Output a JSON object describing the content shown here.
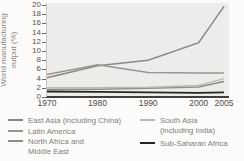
{
  "chart_data": {
    "type": "line",
    "title": "",
    "ylabel": "World manufacturing output (%)",
    "ylabel_lines": [
      "World manufacturing",
      "output (%)"
    ],
    "xlabel": "",
    "xlim": [
      1970,
      2005
    ],
    "ylim": [
      0,
      20
    ],
    "grid": false,
    "legend_position": "bottom",
    "x": [
      1970,
      1980,
      1990,
      2000,
      2005
    ],
    "x_tick_labels": [
      "1970",
      "1980",
      "1990",
      "2000",
      "2005"
    ],
    "y_ticks": [
      0,
      2,
      4,
      6,
      8,
      10,
      12,
      14,
      16,
      18,
      20
    ],
    "series": [
      {
        "name": "East Asia (including China)",
        "color": "#8b8783",
        "values": [
          4.2,
          6.8,
          8.0,
          11.8,
          19.7
        ]
      },
      {
        "name": "Latin America",
        "color": "#9a9591",
        "values": [
          4.9,
          7.0,
          5.3,
          5.2,
          5.2
        ]
      },
      {
        "name": "North Africa and Middle East",
        "color": "#8f8b87",
        "values": [
          1.6,
          1.7,
          1.9,
          2.2,
          3.4
        ]
      },
      {
        "name": "South Asia (including India)",
        "color": "#bcb8b2",
        "values": [
          2.0,
          2.0,
          2.1,
          2.5,
          4.0
        ]
      },
      {
        "name": "Sub-Saharan Africa",
        "color": "#262522",
        "values": [
          1.2,
          1.1,
          1.0,
          0.9,
          1.0
        ]
      }
    ]
  },
  "legend": {
    "items": [
      {
        "label": "East Asia (including China)",
        "series": 0
      },
      {
        "label": "Latin America",
        "series": 1
      },
      {
        "label": "North Africa and\nMiddle East",
        "series": 2
      },
      {
        "label": "South Asia\n(including India)",
        "series": 3
      },
      {
        "label": "Sub-Saharan Africa",
        "series": 4
      }
    ]
  }
}
